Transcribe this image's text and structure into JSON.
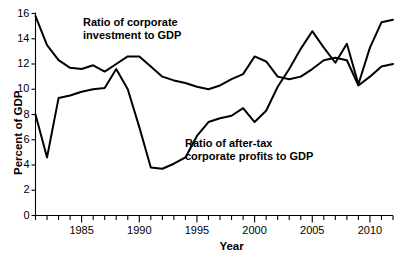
{
  "chart_data": {
    "type": "line",
    "title": "",
    "xlabel": "Year",
    "ylabel": "Percent of GDP",
    "xlim": [
      1981,
      2012
    ],
    "ylim": [
      0,
      16
    ],
    "yticks": [
      0,
      2,
      4,
      6,
      8,
      10,
      12,
      14,
      16
    ],
    "xticks_labeled": [
      1985,
      1990,
      1995,
      2000,
      2005,
      2010
    ],
    "xtick_minor_step": 1,
    "grid": false,
    "legend_position": "inline-annotations",
    "x": [
      1981,
      1982,
      1983,
      1984,
      1985,
      1986,
      1987,
      1988,
      1989,
      1990,
      1991,
      1992,
      1993,
      1994,
      1995,
      1996,
      1997,
      1998,
      1999,
      2000,
      2001,
      2002,
      2003,
      2004,
      2005,
      2006,
      2007,
      2008,
      2009,
      2010,
      2011,
      2012
    ],
    "series": [
      {
        "name": "Ratio of corporate investment to GDP",
        "color": "#000000",
        "values": [
          15.8,
          13.5,
          12.3,
          11.7,
          11.6,
          11.9,
          11.4,
          12.0,
          12.6,
          12.6,
          11.8,
          11.0,
          10.7,
          10.5,
          10.2,
          10.0,
          10.3,
          10.8,
          11.2,
          12.6,
          12.2,
          11.0,
          10.8,
          11.0,
          11.6,
          12.3,
          12.5,
          12.3,
          10.3,
          11.0,
          11.8,
          12.0
        ]
      },
      {
        "name": "Ratio of after-tax corporate profits to GDP",
        "color": "#000000",
        "values": [
          8.0,
          4.6,
          9.3,
          9.5,
          9.8,
          10.0,
          10.1,
          11.6,
          10.0,
          7.0,
          3.8,
          3.7,
          4.1,
          4.6,
          6.3,
          7.4,
          7.7,
          7.9,
          8.5,
          7.4,
          8.3,
          10.2,
          11.6,
          13.2,
          14.6,
          13.3,
          12.1,
          13.6,
          10.4,
          13.3,
          15.3,
          15.5
        ]
      }
    ],
    "annotations": [
      {
        "id": "investment-label",
        "line1": "Ratio of corporate",
        "line2": "investment to GDP"
      },
      {
        "id": "profits-label",
        "line1": "Ratio of after-tax",
        "line2": "corporate profits to GDP"
      }
    ]
  }
}
